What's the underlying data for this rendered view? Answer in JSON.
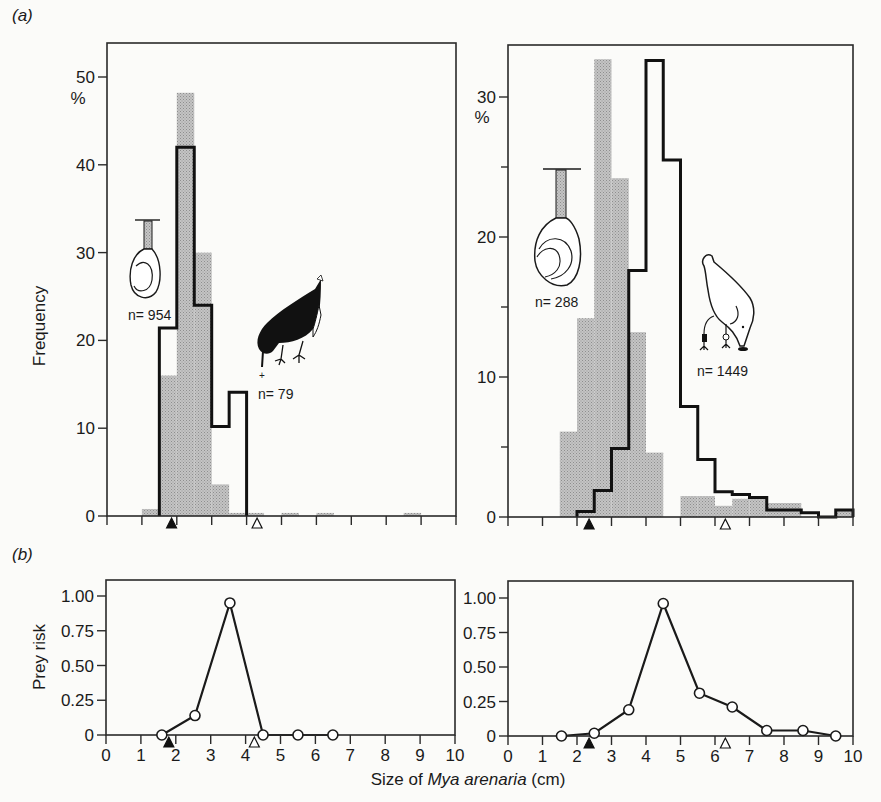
{
  "figure": {
    "panel_a_label": "(a)",
    "panel_b_label": "(b)",
    "xlabel_prefix": "Size of ",
    "xlabel_species": "Mya arenaria",
    "xlabel_suffix": " (cm)",
    "ylabel_a": "Frequency",
    "ylabel_b": "Prey risk",
    "percent_symbol": "%",
    "left_clam_n": "n= 954",
    "left_bird_n": "n= 79",
    "right_clam_n": "n= 288",
    "right_bird_n": "n= 1449",
    "colors": {
      "ink": "#1a1a1a",
      "stipple": "#bdbdbd",
      "paper": "#fbfbf9"
    }
  },
  "chart_data": [
    {
      "id": "a-left",
      "type": "bar",
      "title": "(a) left: prey available vs taken (oystercatcher-like bird, n=79; clams n=954)",
      "xlabel": "Size of Mya arenaria (cm)",
      "ylabel": "Frequency (%)",
      "xlim": [
        0,
        10
      ],
      "ylim": [
        0,
        54
      ],
      "yticks": [
        0,
        10,
        20,
        30,
        40,
        50
      ],
      "xticks": [
        0,
        1,
        2,
        3,
        4,
        5,
        6,
        7,
        8,
        9,
        10
      ],
      "bin_width": 0.5,
      "series": [
        {
          "name": "Clams available (grey stippled, n=954)",
          "style": "filled",
          "bins": [
            [
              1.0,
              0.8
            ],
            [
              1.5,
              16.0
            ],
            [
              2.0,
              48.2
            ],
            [
              2.5,
              30.0
            ],
            [
              3.0,
              3.6
            ],
            [
              3.5,
              0.3
            ],
            [
              4.0,
              0.3
            ],
            [
              5.0,
              0.3
            ],
            [
              6.0,
              0.3
            ],
            [
              8.5,
              0.3
            ]
          ]
        },
        {
          "name": "Clams taken by bird (black outline, n=79)",
          "style": "outline",
          "bins": [
            [
              1.5,
              21.4
            ],
            [
              2.0,
              42.0
            ],
            [
              2.5,
              24.0
            ],
            [
              3.0,
              10.2
            ],
            [
              3.5,
              14.1
            ]
          ]
        }
      ],
      "markers": [
        {
          "type": "filled-triangle",
          "x": 1.85
        },
        {
          "type": "open-triangle",
          "x": 4.3
        }
      ]
    },
    {
      "id": "a-right",
      "type": "bar",
      "title": "(a) right: prey available vs taken (gull-like bird, n=1449; clams n=288)",
      "xlabel": "Size of Mya arenaria (cm)",
      "ylabel": "Frequency (%)",
      "xlim": [
        0,
        10
      ],
      "ylim": [
        0,
        33.5
      ],
      "yticks": [
        0,
        10,
        20,
        30
      ],
      "minor_yticks": [
        5,
        15,
        25
      ],
      "xticks": [
        0,
        1,
        2,
        3,
        4,
        5,
        6,
        7,
        8,
        9,
        10
      ],
      "bin_width": 0.5,
      "series": [
        {
          "name": "Clams available (grey stippled, n=288)",
          "style": "filled",
          "bins": [
            [
              1.5,
              6.1
            ],
            [
              2.0,
              14.2
            ],
            [
              2.5,
              32.7
            ],
            [
              3.0,
              24.2
            ],
            [
              3.5,
              13.2
            ],
            [
              4.0,
              4.6
            ],
            [
              5.0,
              1.5
            ],
            [
              5.5,
              1.5
            ],
            [
              6.0,
              0.8
            ],
            [
              6.5,
              1.3
            ],
            [
              7.0,
              1.3
            ],
            [
              7.5,
              1.0
            ],
            [
              8.0,
              1.0
            ],
            [
              9.5,
              0.5
            ]
          ]
        },
        {
          "name": "Clams taken by bird (black outline, n=1449)",
          "style": "outline",
          "bins": [
            [
              2.0,
              0.4
            ],
            [
              2.5,
              1.9
            ],
            [
              3.0,
              4.9
            ],
            [
              3.5,
              17.6
            ],
            [
              4.0,
              32.6
            ],
            [
              4.5,
              25.5
            ],
            [
              5.0,
              7.9
            ],
            [
              5.5,
              4.1
            ],
            [
              6.0,
              1.8
            ],
            [
              6.5,
              1.6
            ],
            [
              7.0,
              1.4
            ],
            [
              7.5,
              0.5
            ],
            [
              8.0,
              0.5
            ],
            [
              8.5,
              0.3
            ],
            [
              9.0,
              0.0
            ],
            [
              9.5,
              0.5
            ]
          ]
        }
      ],
      "markers": [
        {
          "type": "filled-triangle",
          "x": 2.35
        },
        {
          "type": "open-triangle",
          "x": 6.3
        }
      ]
    },
    {
      "id": "b-left",
      "type": "line",
      "title": "(b) left: prey risk",
      "xlabel": "Size of Mya arenaria (cm)",
      "ylabel": "Prey risk",
      "xlim": [
        0,
        10
      ],
      "ylim": [
        0,
        1.12
      ],
      "yticks": [
        0,
        0.25,
        0.5,
        0.75,
        1.0
      ],
      "ytick_labels": [
        "0",
        "0.25",
        "0.50",
        "0.75",
        "1.00"
      ],
      "xticks": [
        0,
        1,
        2,
        3,
        4,
        5,
        6,
        7,
        8,
        9,
        10
      ],
      "x": [
        1.6,
        2.55,
        3.55,
        4.5,
        5.5,
        6.5
      ],
      "y": [
        0.0,
        0.14,
        0.95,
        0.0,
        0.0,
        0.0
      ],
      "markers": [
        {
          "type": "filled-triangle",
          "x": 1.8
        },
        {
          "type": "open-triangle",
          "x": 4.25
        }
      ]
    },
    {
      "id": "b-right",
      "type": "line",
      "title": "(b) right: prey risk",
      "xlabel": "Size of Mya arenaria (cm)",
      "ylabel": "Prey risk",
      "xlim": [
        0,
        10
      ],
      "ylim": [
        0,
        1.12
      ],
      "yticks": [
        0,
        0.25,
        0.5,
        0.75,
        1.0
      ],
      "ytick_labels": [
        "0",
        "0.25",
        "0.50",
        "0.75",
        "1.00"
      ],
      "xticks": [
        0,
        1,
        2,
        3,
        4,
        5,
        6,
        7,
        8,
        9,
        10
      ],
      "x": [
        1.55,
        2.5,
        3.5,
        4.5,
        5.55,
        6.5,
        7.5,
        8.55,
        9.5
      ],
      "y": [
        0.0,
        0.02,
        0.19,
        0.96,
        0.31,
        0.21,
        0.04,
        0.04,
        0.0
      ],
      "markers": [
        {
          "type": "filled-triangle",
          "x": 2.35
        },
        {
          "type": "open-triangle",
          "x": 6.3
        }
      ]
    }
  ]
}
